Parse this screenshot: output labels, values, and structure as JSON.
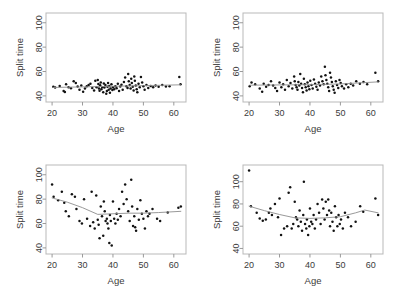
{
  "figure": {
    "panel_count": 4,
    "background": "#ffffff",
    "point_color": "#121212",
    "trend_color": "#8d8d8d",
    "frame_color": "#b9b9b9"
  },
  "chart_data": [
    {
      "type": "scatter",
      "panel": "top-left",
      "title": "",
      "xlabel": "Age",
      "ylabel": "Split time",
      "xlim": [
        18,
        64
      ],
      "ylim": [
        35,
        108
      ],
      "xticks": [
        20,
        30,
        40,
        50,
        60
      ],
      "yticks": [
        40,
        60,
        80,
        100
      ],
      "grid": false,
      "legend": null,
      "x": [
        20.4,
        21.0,
        22.5,
        23.8,
        24.2,
        24.6,
        25.4,
        26.2,
        27.1,
        27.8,
        28.4,
        29.0,
        29.6,
        30.2,
        30.8,
        31.4,
        32.0,
        32.6,
        33.2,
        33.8,
        34.2,
        34.6,
        35.0,
        35.2,
        35.4,
        35.6,
        35.8,
        36.0,
        36.2,
        36.5,
        36.8,
        37.0,
        37.2,
        37.5,
        37.8,
        38.0,
        38.2,
        38.4,
        38.6,
        38.8,
        39.0,
        39.2,
        39.5,
        39.8,
        40.0,
        40.4,
        40.8,
        41.2,
        41.6,
        42.0,
        42.4,
        42.8,
        43.2,
        43.6,
        44.0,
        44.4,
        44.8,
        45.0,
        45.2,
        45.5,
        45.8,
        46.0,
        46.2,
        46.5,
        46.8,
        47.0,
        47.2,
        47.5,
        47.8,
        48.0,
        48.4,
        48.8,
        49.2,
        49.6,
        50.0,
        50.4,
        51.0,
        51.6,
        52.4,
        53.2,
        54.0,
        55.0,
        56.2,
        57.4,
        58.6,
        61.8,
        62.2
      ],
      "y": [
        47.5,
        46.8,
        48.2,
        44.0,
        43.2,
        49.5,
        47.0,
        46.2,
        52.0,
        50.5,
        47.8,
        45.0,
        48.5,
        43.5,
        46.0,
        48.0,
        49.0,
        50.0,
        46.5,
        44.5,
        52.5,
        47.2,
        53.0,
        49.8,
        46.0,
        44.2,
        48.8,
        51.0,
        45.5,
        47.0,
        43.0,
        50.2,
        46.8,
        49.0,
        41.8,
        44.0,
        47.5,
        50.5,
        45.0,
        48.2,
        42.5,
        46.0,
        49.5,
        44.8,
        47.0,
        45.5,
        48.0,
        46.2,
        50.0,
        44.0,
        47.8,
        49.2,
        45.0,
        51.5,
        55.0,
        48.0,
        46.5,
        58.0,
        52.0,
        49.0,
        46.0,
        54.0,
        50.5,
        47.5,
        44.5,
        56.0,
        52.5,
        48.5,
        45.5,
        43.0,
        50.0,
        47.0,
        55.5,
        51.0,
        48.0,
        45.0,
        49.0,
        46.5,
        48.2,
        47.0,
        48.5,
        47.5,
        49.0,
        47.8,
        48.0,
        55.5,
        49.5
      ],
      "trend": {
        "x": [
          20.4,
          30.0,
          40.0,
          50.0,
          62.2
        ],
        "y": [
          46.9,
          47.4,
          47.9,
          48.4,
          49.1
        ]
      }
    },
    {
      "type": "scatter",
      "panel": "top-right",
      "title": "",
      "xlabel": "Age",
      "ylabel": "Split time",
      "xlim": [
        18,
        64
      ],
      "ylim": [
        35,
        108
      ],
      "xticks": [
        20,
        30,
        40,
        50,
        60
      ],
      "yticks": [
        40,
        60,
        80,
        100
      ],
      "grid": false,
      "legend": null,
      "x": [
        20.2,
        20.8,
        22.0,
        23.5,
        24.3,
        24.8,
        25.6,
        26.4,
        27.2,
        27.9,
        28.6,
        29.2,
        30.0,
        30.6,
        31.2,
        31.8,
        32.4,
        33.0,
        33.6,
        34.2,
        34.8,
        35.0,
        35.3,
        35.6,
        35.9,
        36.2,
        36.5,
        36.8,
        37.1,
        37.4,
        37.7,
        38.0,
        38.3,
        38.6,
        38.9,
        39.2,
        39.5,
        39.8,
        40.1,
        40.5,
        40.9,
        41.3,
        41.7,
        42.1,
        42.5,
        42.9,
        43.3,
        43.7,
        44.1,
        44.5,
        44.9,
        45.1,
        45.4,
        45.7,
        46.0,
        46.3,
        46.6,
        46.9,
        47.2,
        47.5,
        47.8,
        48.1,
        48.5,
        48.9,
        49.3,
        49.7,
        50.1,
        50.5,
        51.2,
        51.9,
        52.6,
        53.4,
        54.2,
        55.2,
        56.4,
        57.6,
        58.8,
        61.5,
        62.4
      ],
      "y": [
        48.0,
        51.0,
        49.5,
        46.0,
        43.5,
        50.0,
        47.5,
        49.0,
        52.0,
        48.5,
        46.5,
        44.0,
        51.0,
        47.0,
        49.5,
        45.0,
        53.0,
        48.0,
        50.5,
        46.0,
        56.0,
        52.0,
        49.0,
        47.0,
        45.0,
        51.5,
        48.5,
        58.0,
        50.0,
        46.5,
        43.0,
        54.0,
        49.5,
        47.0,
        44.5,
        51.0,
        48.0,
        45.5,
        52.5,
        49.0,
        46.0,
        53.5,
        50.0,
        47.5,
        45.0,
        51.0,
        48.5,
        56.0,
        52.0,
        49.5,
        64.0,
        57.0,
        53.0,
        50.0,
        47.0,
        44.0,
        59.0,
        55.0,
        51.5,
        48.0,
        45.0,
        42.5,
        52.0,
        49.0,
        46.5,
        53.0,
        50.5,
        48.0,
        46.0,
        49.5,
        47.0,
        50.0,
        48.5,
        52.0,
        50.0,
        51.5,
        49.5,
        59.0,
        52.0
      ],
      "trend": {
        "x": [
          20.2,
          30.0,
          40.0,
          50.0,
          62.4
        ],
        "y": [
          48.8,
          49.0,
          49.2,
          49.8,
          51.5
        ]
      }
    },
    {
      "type": "scatter",
      "panel": "bottom-left",
      "title": "",
      "xlabel": "Age",
      "ylabel": "Split time",
      "xlim": [
        18,
        64
      ],
      "ylim": [
        35,
        108
      ],
      "xticks": [
        20,
        30,
        40,
        50,
        60
      ],
      "yticks": [
        40,
        60,
        80,
        100
      ],
      "grid": false,
      "legend": null,
      "x": [
        20.0,
        20.5,
        22.0,
        23.2,
        24.0,
        24.5,
        25.5,
        26.5,
        27.5,
        28.0,
        29.0,
        29.8,
        30.5,
        31.5,
        32.5,
        33.0,
        33.5,
        34.0,
        34.5,
        35.0,
        35.3,
        35.6,
        36.0,
        36.4,
        36.8,
        37.0,
        37.3,
        37.6,
        38.0,
        38.2,
        38.5,
        38.8,
        39.0,
        39.3,
        39.6,
        40.0,
        40.4,
        40.8,
        41.2,
        41.6,
        42.0,
        42.5,
        43.0,
        43.5,
        44.0,
        44.5,
        45.0,
        45.5,
        46.0,
        46.3,
        46.6,
        47.0,
        47.3,
        47.6,
        48.0,
        48.5,
        49.0,
        49.5,
        50.0,
        50.5,
        51.0,
        51.5,
        52.0,
        53.0,
        54.5,
        55.5,
        58.0,
        61.5,
        62.3
      ],
      "y": [
        92.0,
        82.0,
        79.0,
        86.0,
        77.0,
        70.0,
        66.0,
        84.0,
        82.0,
        72.0,
        62.0,
        60.0,
        80.0,
        64.0,
        58.0,
        86.0,
        61.0,
        56.0,
        83.0,
        63.0,
        59.0,
        48.0,
        74.0,
        66.0,
        50.0,
        78.0,
        70.0,
        62.0,
        64.0,
        60.0,
        56.0,
        44.0,
        67.0,
        62.0,
        42.0,
        78.0,
        64.0,
        60.0,
        68.0,
        63.0,
        72.0,
        66.0,
        86.0,
        76.0,
        92.0,
        80.0,
        70.0,
        62.0,
        96.0,
        74.0,
        58.0,
        66.0,
        57.0,
        54.0,
        72.0,
        63.0,
        79.0,
        68.0,
        64.0,
        56.0,
        70.0,
        66.0,
        68.0,
        72.0,
        64.0,
        62.0,
        69.0,
        73.0,
        74.0
      ],
      "trend": {
        "x": [
          20.0,
          25.0,
          30.0,
          35.0,
          40.0,
          45.0,
          50.0,
          55.0,
          62.3
        ],
        "y": [
          81.0,
          77.5,
          73.0,
          67.5,
          68.0,
          68.5,
          68.5,
          69.0,
          70.0
        ]
      }
    },
    {
      "type": "scatter",
      "panel": "bottom-right",
      "title": "",
      "xlabel": "Age",
      "ylabel": "Split time",
      "xlim": [
        18,
        64
      ],
      "ylim": [
        35,
        115
      ],
      "xticks": [
        20,
        30,
        40,
        50,
        60
      ],
      "yticks": [
        40,
        60,
        80,
        100
      ],
      "grid": false,
      "legend": null,
      "x": [
        20.0,
        20.6,
        22.5,
        23.5,
        24.5,
        25.5,
        26.5,
        27.0,
        27.5,
        28.5,
        29.5,
        30.0,
        30.5,
        31.5,
        32.5,
        33.0,
        33.5,
        34.0,
        34.5,
        35.0,
        35.4,
        35.8,
        36.2,
        36.6,
        37.0,
        37.4,
        37.8,
        38.0,
        38.4,
        38.8,
        39.0,
        39.4,
        39.8,
        40.0,
        40.4,
        40.8,
        41.2,
        41.6,
        42.0,
        42.5,
        43.0,
        43.5,
        44.0,
        44.4,
        44.8,
        45.2,
        45.6,
        46.0,
        46.3,
        46.6,
        47.0,
        47.4,
        47.8,
        48.2,
        48.6,
        49.0,
        49.4,
        49.8,
        50.2,
        50.8,
        51.5,
        52.5,
        53.5,
        55.0,
        56.5,
        57.5,
        61.5,
        62.4
      ],
      "y": [
        110.0,
        78.0,
        72.0,
        67.0,
        65.0,
        66.0,
        72.0,
        76.0,
        70.0,
        80.0,
        68.0,
        85.0,
        52.0,
        58.0,
        60.0,
        90.0,
        95.0,
        58.0,
        62.0,
        82.0,
        68.0,
        66.0,
        60.0,
        74.0,
        64.0,
        56.0,
        70.0,
        100.0,
        62.0,
        58.0,
        66.0,
        52.0,
        60.0,
        76.0,
        64.0,
        62.0,
        70.0,
        58.0,
        66.0,
        80.0,
        72.0,
        62.0,
        84.0,
        76.0,
        66.0,
        82.0,
        70.0,
        84.0,
        74.0,
        60.0,
        72.0,
        64.0,
        56.0,
        78.0,
        68.0,
        60.0,
        70.0,
        62.0,
        66.0,
        58.0,
        72.0,
        68.0,
        60.0,
        64.0,
        78.0,
        73.0,
        85.0,
        70.0
      ],
      "trend": {
        "x": [
          20.0,
          25.0,
          30.0,
          35.0,
          40.0,
          45.0,
          50.0,
          55.0,
          58.0,
          62.4
        ],
        "y": [
          78.0,
          74.0,
          70.5,
          67.5,
          67.0,
          67.5,
          68.5,
          72.0,
          74.5,
          72.0
        ]
      }
    }
  ]
}
